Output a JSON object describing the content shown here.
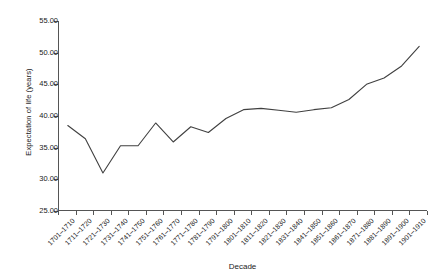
{
  "chart_data": {
    "type": "line",
    "title": "",
    "xlabel": "Decade",
    "ylabel": "Expectation of life (years)",
    "ylim": [
      25.0,
      55.0
    ],
    "yticks": [
      "25.00",
      "30.00",
      "35.00",
      "40.00",
      "45.00",
      "50.00",
      "55.00"
    ],
    "ytick_values": [
      25,
      30,
      35,
      40,
      45,
      50,
      55
    ],
    "grid": false,
    "legend": false,
    "legend_position": "none",
    "categories": [
      "1701–1710",
      "1711–1720",
      "1721–1730",
      "1731–1740",
      "1741–1750",
      "1751–1760",
      "1761–1770",
      "1771–1780",
      "1781–1790",
      "1791–1800",
      "1801–1810",
      "1811–1820",
      "1821–1830",
      "1831–1840",
      "1841–1850",
      "1851–1860",
      "1861–1870",
      "1871–1880",
      "1881–1890",
      "1891–1900",
      "1901–1910"
    ],
    "values": [
      38.5,
      36.4,
      31.0,
      35.3,
      35.3,
      38.9,
      35.9,
      38.3,
      37.4,
      39.6,
      41.0,
      41.2,
      40.9,
      40.6,
      41.0,
      41.3,
      42.6,
      45.0,
      46.0,
      47.9,
      51.0
    ],
    "line_color": "#404040",
    "line_width": 1.1,
    "axis_color": "#555555",
    "background_color": "#ffffff"
  }
}
